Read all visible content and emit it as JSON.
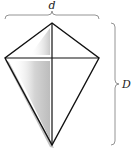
{
  "diagram": {
    "labels": {
      "short_diagonal": "d",
      "long_diagonal": "D"
    },
    "colors": {
      "stroke": "#111111",
      "brace": "#888888",
      "shadow": "#9a9a9a",
      "background": "#ffffff"
    },
    "vertices": {
      "top": [
        52,
        23
      ],
      "left": [
        5,
        58
      ],
      "right": [
        99,
        58
      ],
      "bottom": [
        52,
        145
      ]
    }
  }
}
